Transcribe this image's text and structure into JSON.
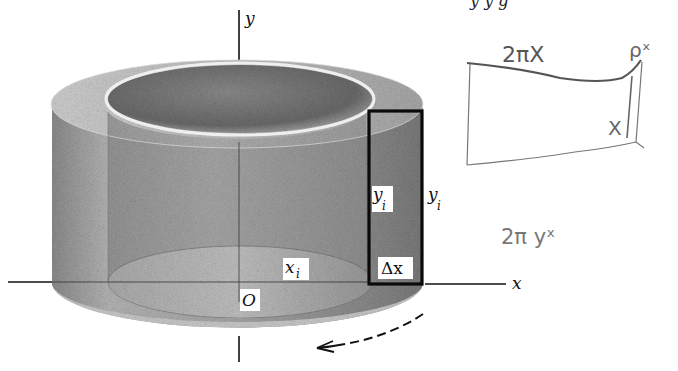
{
  "figure": {
    "type": "shell-method-cylinder-diagram",
    "top_cut_text": "y     y     g",
    "axes": {
      "x_label": "x",
      "y_label": "y",
      "origin_label": "O"
    },
    "labels": {
      "inner_height": "y",
      "inner_height_sub": "i",
      "outer_height": "y",
      "outer_height_sub": "i",
      "radius": "x",
      "radius_sub": "i",
      "thickness": "Δx"
    },
    "rotation_arrow": "counterclockwise-rotation-arrow"
  },
  "handwritten_notes": {
    "circumference": "2πX",
    "top_right": "ρˣ",
    "inner_mark": "X",
    "formula": "2π yˣ"
  },
  "colors": {
    "ink": "#111111",
    "shading_dark": "#6a6a6a",
    "shading_mid": "#9a9a9a",
    "shading_light": "#d4d4d4",
    "pencil": "#6b6b6b"
  }
}
